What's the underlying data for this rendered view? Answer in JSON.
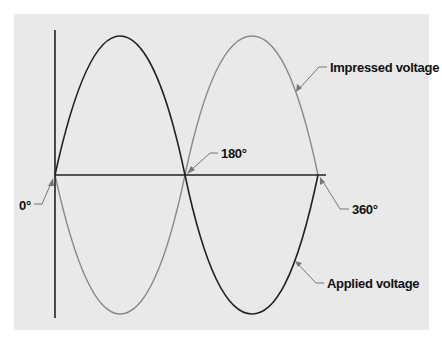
{
  "diagram": {
    "title": "",
    "labels": {
      "zero": "0°",
      "half": "180°",
      "full": "360°",
      "impressed": "Impressed voltage",
      "applied": "Applied voltage"
    },
    "series": [
      {
        "name": "Applied voltage",
        "color": "#222222",
        "phase_deg": 0,
        "description": "positive half-cycle 0°–180°, negative half-cycle 180°–360°"
      },
      {
        "name": "Impressed voltage",
        "color": "#8a8a8a",
        "phase_deg": 180,
        "description": "negative half-cycle 0°–180°, positive half-cycle 180°–360°"
      }
    ],
    "colors": {
      "panel": "#e9e9e9",
      "axis": "#222222",
      "applied": "#222222",
      "impressed": "#8a8a8a",
      "arrow": "#777777"
    }
  }
}
